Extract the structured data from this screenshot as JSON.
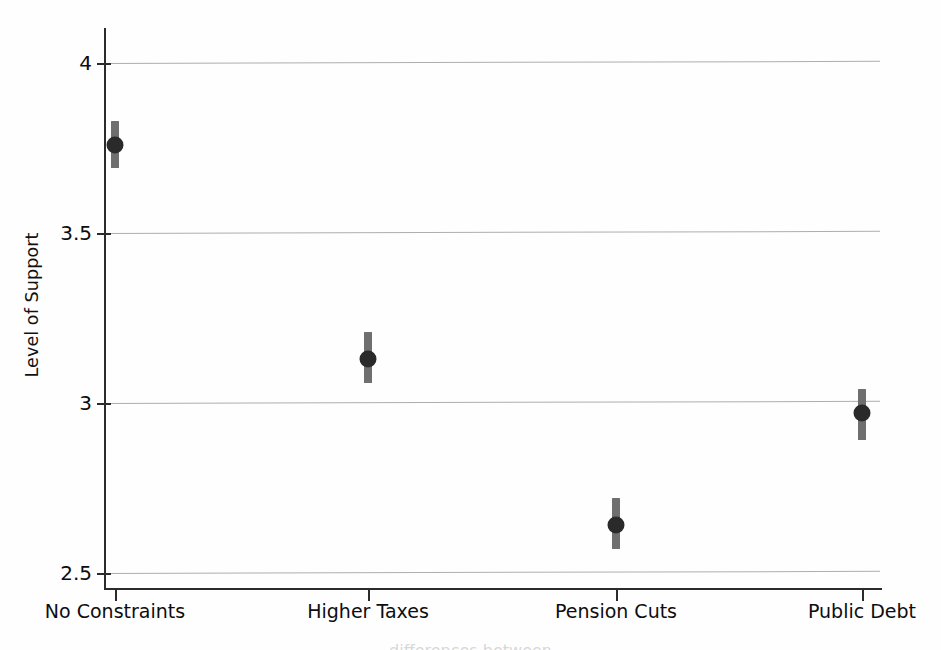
{
  "chart_data": {
    "type": "scatter",
    "title": "",
    "subtitle": "",
    "xlabel": "",
    "ylabel": "Level of Support",
    "categories": [
      "No Constraints",
      "Higher Taxes",
      "Pension Cuts",
      "Public Debt"
    ],
    "values": [
      3.76,
      3.13,
      2.64,
      2.97
    ],
    "error_low": [
      3.69,
      3.06,
      2.57,
      2.89
    ],
    "error_high": [
      3.83,
      3.21,
      2.72,
      3.04
    ],
    "series": [
      {
        "name": "Level of Support",
        "values": [
          3.76,
          3.13,
          2.64,
          2.97
        ],
        "error_low": [
          3.69,
          3.06,
          2.57,
          2.89
        ],
        "error_high": [
          3.83,
          3.21,
          2.72,
          3.04
        ]
      }
    ],
    "ylim": [
      2.45,
      4.07
    ],
    "yticks": [
      4,
      3.5,
      3,
      2.5
    ],
    "ytick_labels": [
      "4",
      "3.5",
      "3",
      "2.5"
    ],
    "grid": "horizontal",
    "legend": "none",
    "marker_color": "#2a2a2a",
    "error_color": "#6f6f6f",
    "grid_color": "#aeaeae",
    "axis_color": "#2b2b2b",
    "annotations": []
  },
  "caption": {
    "remnant": "differences between"
  }
}
